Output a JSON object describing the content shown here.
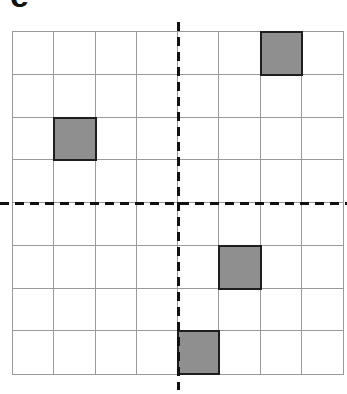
{
  "panel": {
    "label": "e"
  },
  "grid": {
    "rows": 8,
    "cols": 8,
    "shaded_cells": [
      {
        "row": 0,
        "col": 6
      },
      {
        "row": 2,
        "col": 1
      },
      {
        "row": 5,
        "col": 5
      },
      {
        "row": 7,
        "col": 4
      }
    ],
    "colors": {
      "grid_line": "#9a9a9a",
      "shaded_fill": "#8f8f8f",
      "shaded_border": "#1e1e1e",
      "axis": "#111111"
    }
  },
  "axes": {
    "vertical_axis": "dashed line between column 4 and 5",
    "horizontal_axis": "dashed line between row 4 and 5"
  }
}
